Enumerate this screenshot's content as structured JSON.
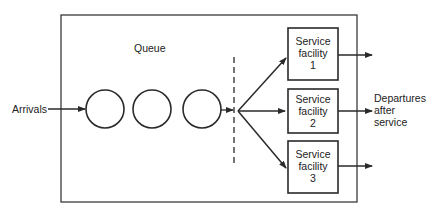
{
  "diagram": {
    "type": "queueing-system",
    "title": "",
    "queue_label": "Queue",
    "arrivals_label": "Arrivals",
    "departures_label": [
      "Departures",
      "after",
      "service"
    ],
    "queue_items": 3,
    "service_facilities": [
      {
        "line1": "Service",
        "line2": "facility",
        "number": "1"
      },
      {
        "line1": "Service",
        "line2": "facility",
        "number": "2"
      },
      {
        "line1": "Service",
        "line2": "facility",
        "number": "3"
      }
    ],
    "colors": {
      "stroke": "#2a2a2a",
      "text": "#222222",
      "background": "#ffffff"
    }
  }
}
